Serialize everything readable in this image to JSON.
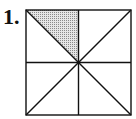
{
  "problem": {
    "number_label": "1."
  },
  "figure": {
    "type": "square divided into 8 triangles",
    "total_parts": 8,
    "shaded_parts": 1,
    "shaded_region": "top-left triangle between top edge, vertical midline and main diagonal",
    "stroke_color": "#111111",
    "shade_color": "#c8c8c8",
    "square": {
      "x": 26,
      "y": 10,
      "size": 105
    },
    "center": {
      "x": 78.5,
      "y": 62.5
    }
  }
}
